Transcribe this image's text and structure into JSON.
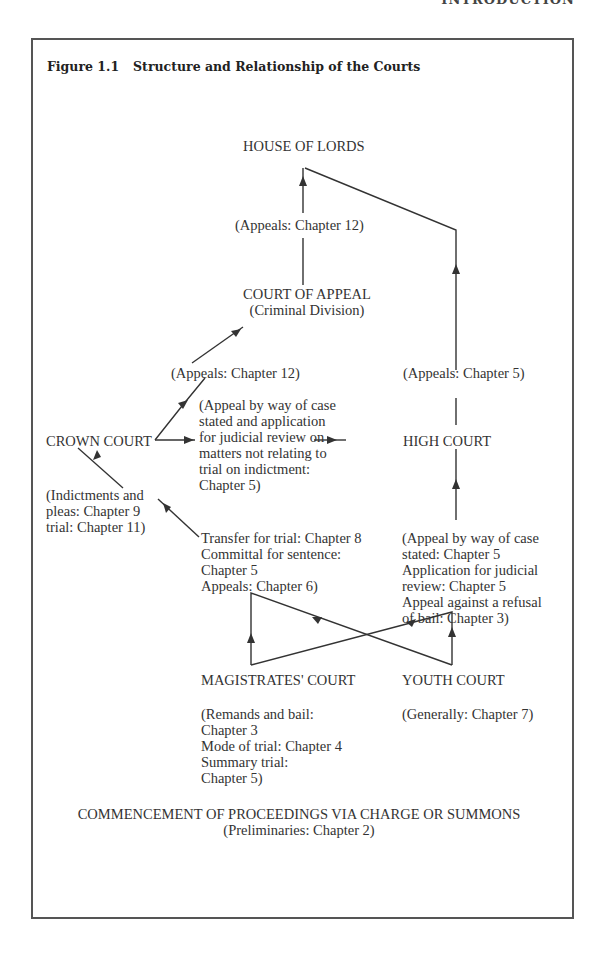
{
  "running_head": "INTRODUCTION",
  "figure": {
    "number": "Figure 1.1",
    "title": "Structure and Relationship of the Courts"
  },
  "nodes": {
    "house_of_lords": "HOUSE OF LORDS",
    "appeals_ch12_top": "(Appeals: Chapter 12)",
    "court_of_appeal": "COURT OF APPEAL",
    "criminal_division": "(Criminal Division)",
    "appeals_ch12_mid": "(Appeals: Chapter 12)",
    "appeals_ch5": "(Appeals: Chapter 5)",
    "case_stated_note": "(Appeal by way of case\nstated and application\nfor judicial review on\nmatters not relating to\ntrial on indictment:\nChapter 5)",
    "crown_court": "CROWN COURT",
    "high_court": "HIGH COURT",
    "indictments_note": "(Indictments and\npleas: Chapter 9\ntrial: Chapter 11)",
    "transfer_note": "Transfer for trial: Chapter 8\nCommittal for sentence:\nChapter 5\nAppeals: Chapter 6)",
    "youth_appeal_note": "(Appeal by way of case\nstated: Chapter 5\nApplication for judicial\nreview: Chapter 5\nAppeal against a refusal\nof bail: Chapter 3)",
    "magistrates_court": "MAGISTRATES' COURT",
    "youth_court": "YOUTH COURT",
    "magistrates_note": "(Remands and bail:\nChapter 3\nMode of trial: Chapter 4\nSummary trial:\nChapter 5)",
    "youth_note": "(Generally: Chapter 7)",
    "commencement": "COMMENCEMENT OF PROCEEDINGS VIA CHARGE OR SUMMONS",
    "preliminaries": "(Preliminaries: Chapter 2)"
  },
  "colors": {
    "line": "#333333",
    "frame": "#555555",
    "text": "#333333"
  }
}
